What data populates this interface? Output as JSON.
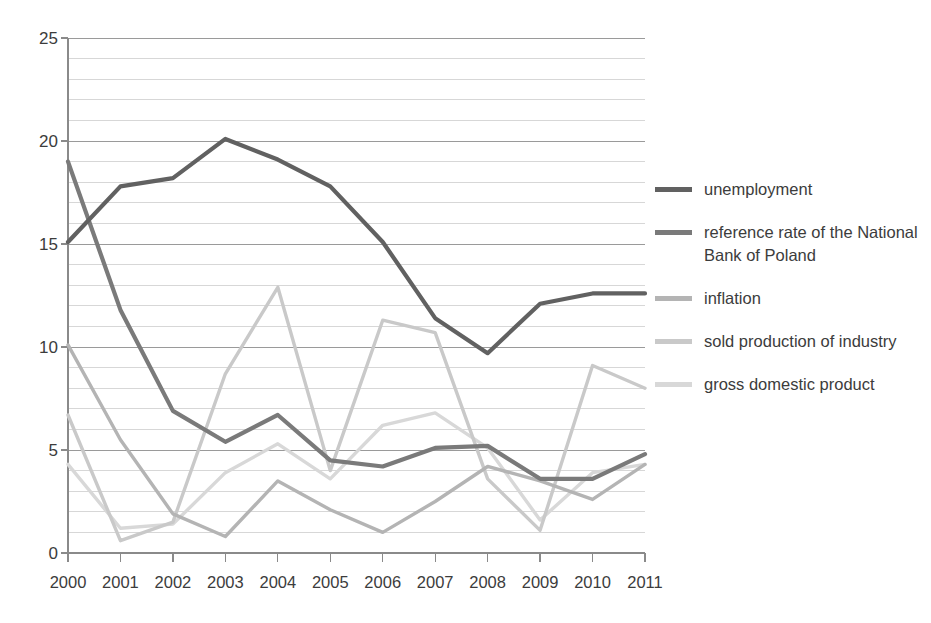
{
  "chart_data": {
    "type": "line",
    "title": "",
    "subtitle": "",
    "xlabel": "",
    "ylabel": "",
    "categories": [
      "2000",
      "2001",
      "2002",
      "2003",
      "2004",
      "2005",
      "2006",
      "2007",
      "2008",
      "2009",
      "2010",
      "2011"
    ],
    "x": [
      2000,
      2001,
      2002,
      2003,
      2004,
      2005,
      2006,
      2007,
      2008,
      2009,
      2010,
      2011
    ],
    "xlim": [
      2000,
      2011
    ],
    "ylim": [
      0,
      25
    ],
    "y_ticks": [
      0,
      5,
      10,
      15,
      20,
      25
    ],
    "y_tick_labels": [
      "0",
      "5",
      "10",
      "15",
      "20",
      "25"
    ],
    "y_minor_step": 1,
    "grid": "horizontal-minor-and-major",
    "legend_position": "right",
    "series": [
      {
        "name": "unemployment",
        "color": "#616161",
        "values": [
          15.1,
          17.8,
          18.2,
          20.1,
          19.1,
          17.8,
          15.1,
          11.4,
          9.7,
          12.1,
          12.6,
          12.6
        ]
      },
      {
        "name": "reference rate of the National Bank of Poland",
        "color": "#7a7a7a",
        "values": [
          19.0,
          11.8,
          6.9,
          5.4,
          6.7,
          4.5,
          4.2,
          5.1,
          5.2,
          3.6,
          3.6,
          4.8
        ]
      },
      {
        "name": "inflation",
        "color": "#b4b4b4",
        "values": [
          10.1,
          5.5,
          1.9,
          0.8,
          3.5,
          2.1,
          1.0,
          2.5,
          4.2,
          3.5,
          2.6,
          4.3
        ]
      },
      {
        "name": "sold production of industry",
        "color": "#c9c9c9",
        "values": [
          6.7,
          0.6,
          1.5,
          8.7,
          12.9,
          4.0,
          11.3,
          10.7,
          3.6,
          1.1,
          9.1,
          8.0
        ]
      },
      {
        "name": "gross domestic product",
        "color": "#d8d8d8",
        "values": [
          4.3,
          1.2,
          1.4,
          3.9,
          5.3,
          3.6,
          6.2,
          6.8,
          5.1,
          1.6,
          3.9,
          4.3
        ]
      }
    ]
  },
  "legend": {
    "items": [
      {
        "label": "unemployment",
        "color": "#616161"
      },
      {
        "label": "reference rate of the National Bank of Poland",
        "color": "#7a7a7a"
      },
      {
        "label": "inflation",
        "color": "#b4b4b4"
      },
      {
        "label": "sold production of industry",
        "color": "#c9c9c9"
      },
      {
        "label": "gross domestic product",
        "color": "#d8d8d8"
      }
    ]
  },
  "axes": {
    "y_tick_labels": [
      "25",
      "20",
      "15",
      "10",
      "5",
      "0"
    ],
    "x_tick_labels": [
      "2000",
      "2001",
      "2002",
      "2003",
      "2004",
      "2005",
      "2006",
      "2007",
      "2008",
      "2009",
      "2010",
      "2011"
    ]
  },
  "colors": {
    "axis": "#8a8a8a",
    "grid_minor": "#d7d7d7",
    "grid_major": "#9a9a9a",
    "text": "#3c3c3c",
    "background": "#ffffff"
  }
}
